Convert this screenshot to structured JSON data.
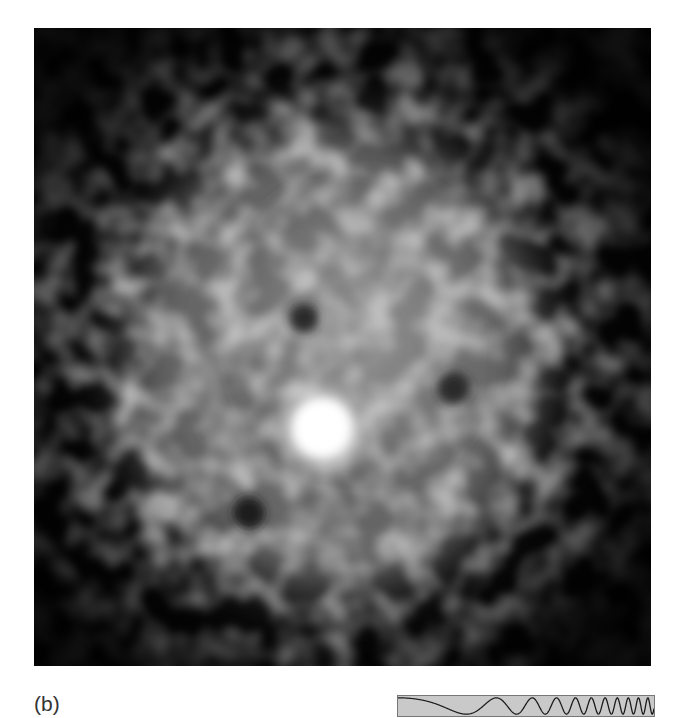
{
  "figure": {
    "panel_label": "(b)",
    "image": {
      "description": "grayscale speckle image with central diffuse glow and bright spot",
      "background_color": "#050505",
      "bright_spot": {
        "cx": 288,
        "cy": 400,
        "r": 30,
        "color": "#ffffff"
      },
      "glow": {
        "cx": 300,
        "cy": 330,
        "rx": 210,
        "ry": 240,
        "color": "#8a8a8a"
      }
    },
    "chirp_strip": {
      "description": "chirp waveform with increasing frequency",
      "background_color": "#c9c9c9",
      "line_color": "#1a1a1a"
    }
  }
}
